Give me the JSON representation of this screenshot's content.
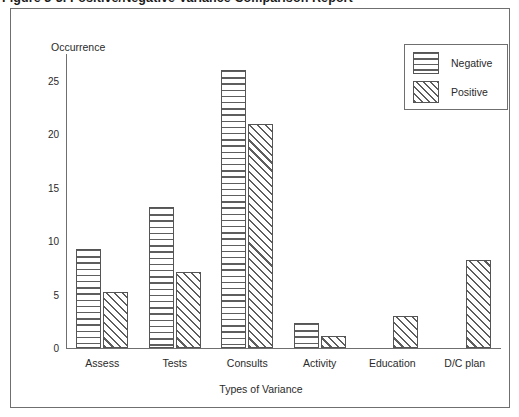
{
  "figure": {
    "caption": "Figure 3-3.  Positive/Negative Variance Comparison Report"
  },
  "chart_data": {
    "type": "bar",
    "title": "",
    "xlabel": "Types of Variance",
    "ylabel": "Occurrence",
    "categories": [
      "Assess",
      "Tests",
      "Consults",
      "Activity",
      "Education",
      "D/C plan"
    ],
    "series": [
      {
        "name": "Negative",
        "values": [
          9.3,
          13.2,
          26,
          2.3,
          0,
          0
        ],
        "fill": "horizontal-lines"
      },
      {
        "name": "Positive",
        "values": [
          5.2,
          7.1,
          21,
          1.1,
          3,
          8.2
        ],
        "fill": "diagonal-hatch"
      }
    ],
    "ylim": [
      0,
      27.5
    ],
    "yticks": [
      0,
      5,
      10,
      15,
      20,
      25
    ],
    "ytick_labels": [
      "0",
      "5",
      "10",
      "15",
      "20",
      "25"
    ],
    "grid": false,
    "legend_position": "top-right",
    "legend_entries": [
      "Negative",
      "Positive"
    ]
  },
  "colors": {
    "frame": "#6f6f6f",
    "axis": "#6f6f6f",
    "bar_outline": "#555555",
    "hatch": "#5e5e5e",
    "text": "#2a2a2a",
    "background": "#ffffff"
  }
}
